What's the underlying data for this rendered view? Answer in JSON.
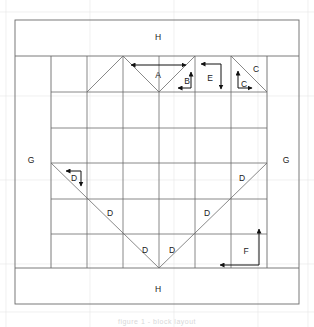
{
  "figure": {
    "caption": "figure 1 - block layout",
    "background_color": "#ffffff",
    "line_color": "#6b6b6b",
    "faint_line_color": "#d9d9d9",
    "arrow_color": "#111111",
    "text_color": "#1a1a1a"
  },
  "labels": [
    {
      "id": "label-H-top",
      "text": "H",
      "x": 158,
      "y": 38
    },
    {
      "id": "label-A",
      "text": "A",
      "x": 158,
      "y": 76
    },
    {
      "id": "label-B",
      "text": "B",
      "x": 187,
      "y": 82
    },
    {
      "id": "label-E",
      "text": "E",
      "x": 210,
      "y": 79
    },
    {
      "id": "label-C-upper",
      "text": "C",
      "x": 256,
      "y": 70
    },
    {
      "id": "label-C-lower",
      "text": "C",
      "x": 244,
      "y": 85
    },
    {
      "id": "label-G-left",
      "text": "G",
      "x": 31,
      "y": 161
    },
    {
      "id": "label-G-right",
      "text": "G",
      "x": 286,
      "y": 161
    },
    {
      "id": "label-D-corner",
      "text": "D",
      "x": 74,
      "y": 179
    },
    {
      "id": "label-D-left",
      "text": "D",
      "x": 110,
      "y": 214
    },
    {
      "id": "label-D-right",
      "text": "D",
      "x": 207,
      "y": 214
    },
    {
      "id": "label-D-farright",
      "text": "D",
      "x": 242,
      "y": 179
    },
    {
      "id": "label-D-bl",
      "text": "D",
      "x": 145,
      "y": 251
    },
    {
      "id": "label-D-br",
      "text": "D",
      "x": 172,
      "y": 251
    },
    {
      "id": "label-F",
      "text": "F",
      "x": 246,
      "y": 252
    },
    {
      "id": "label-H-bottom",
      "text": "H",
      "x": 158,
      "y": 290
    }
  ],
  "pieces": {
    "A": "large heart top triangle",
    "B": "small corner square",
    "C": "corner triangle pair",
    "D": "half square triangle",
    "E": "side rectangle",
    "F": "outer border strip",
    "G": "side sashing",
    "H": "top and bottom sashing"
  },
  "arrows": {
    "A": {
      "label": "A",
      "direction": "double-horizontal"
    },
    "B": {
      "label": "B",
      "direction": "up-and-left"
    },
    "C": {
      "label": "C",
      "direction": "up-and-right"
    },
    "D": {
      "label": "D",
      "direction": "left-and-down"
    },
    "E": {
      "label": "E",
      "direction": "left-and-down"
    },
    "F": {
      "label": "F",
      "direction": "up-and-left"
    }
  }
}
